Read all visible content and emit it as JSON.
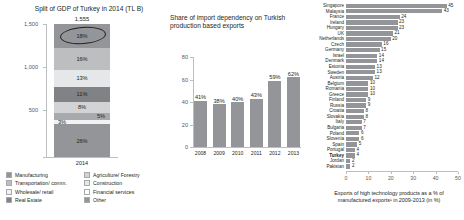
{
  "chart_data": [
    {
      "type": "bar",
      "id": "gdp-split",
      "title": "Split of GDP of Turkey in 2014 (TL B)",
      "xlabel": "2014",
      "ylabel": "",
      "ylim": [
        0,
        1555
      ],
      "yticks": [
        "500",
        "1,000",
        "1,500"
      ],
      "total_label": "1,555",
      "categories": [
        "2014"
      ],
      "stack_order_top_to_bottom": [
        {
          "label": "18%",
          "value": 18,
          "name": "Manufacturing",
          "color": "#939598"
        },
        {
          "label": "16%",
          "value": 16,
          "name": "Transportation/ comm.",
          "color": "#bcbec0"
        },
        {
          "label": "13%",
          "value": 13,
          "name": "Wholesale/ retail",
          "color": "#e6e7e8"
        },
        {
          "label": "11%",
          "value": 11,
          "name": "Real Estate",
          "color": "#808285"
        },
        {
          "label": "8%",
          "value": 8,
          "name": "Agriculture/ Forestry",
          "color": "#d1d3d4"
        },
        {
          "label": "5%",
          "value": 5,
          "name": "Construction",
          "color": "#a7a9ac"
        },
        {
          "label": "3%",
          "value": 3,
          "name": "Financial services",
          "color": "#f1f2f2"
        },
        {
          "label": "26%",
          "value": 26,
          "name": "Other",
          "color": "#939598"
        }
      ],
      "annotation": "ellipse-highlight-on-manufacturing",
      "legend": [
        {
          "label": "Manufacturing",
          "color": "#939598"
        },
        {
          "label": "Agriculture/ Forestry",
          "color": "#d1d3d4"
        },
        {
          "label": "Transportation/ comm.",
          "color": "#bcbec0"
        },
        {
          "label": "Construction",
          "color": "#e6e7e8"
        },
        {
          "label": "Wholesale/ retail",
          "color": "#f1f2f2"
        },
        {
          "label": "Financial services",
          "color": "#ffffff"
        },
        {
          "label": "Real Estate",
          "color": "#808285"
        },
        {
          "label": "Other",
          "color": "#939598"
        }
      ]
    },
    {
      "type": "bar",
      "id": "import-dependency",
      "title": "Share of import dependency on Turkish production based exports",
      "xlabel": "",
      "ylabel": "",
      "ylim": [
        0,
        80
      ],
      "yticks": [
        "0",
        "20",
        "40",
        "60",
        "80"
      ],
      "categories": [
        "2008",
        "2009",
        "2010",
        "2011",
        "2012",
        "2013"
      ],
      "values": [
        41,
        38,
        40,
        43,
        59,
        62
      ],
      "value_labels": [
        "41%",
        "38%",
        "40%",
        "43%",
        "59%",
        "62%"
      ],
      "bar_color": "#939598"
    },
    {
      "type": "bar",
      "id": "high-tech-exports",
      "orientation": "horizontal",
      "title": "",
      "caption": "Exports of high technology products as a % of manufactured exports¹ in 2009-2013 (in %)",
      "xlim": [
        0,
        50
      ],
      "xticks": [
        "0",
        "10",
        "20",
        "30",
        "40",
        "50"
      ],
      "bar_color": "#939598",
      "highlight": "Turkey",
      "categories": [
        "Singapore",
        "Malaysia",
        "France",
        "Ireland",
        "Hungary",
        "UK",
        "Netherlands",
        "Czech",
        "Germany",
        "Israel",
        "Denmark",
        "Estonia",
        "Sweden",
        "Austria",
        "Belgium",
        "Romania",
        "Greece",
        "Finland",
        "Russia",
        "Croatia",
        "Slovakia",
        "Italy",
        "Bulgaria",
        "Poland",
        "Slovenia",
        "Spain",
        "Portugal",
        "Turkey",
        "Jordan",
        "Pakistan"
      ],
      "values": [
        45,
        43,
        24,
        23,
        23,
        21,
        20,
        16,
        15,
        14,
        14,
        13,
        13,
        12,
        10,
        10,
        10,
        9,
        9,
        8,
        8,
        7,
        7,
        6,
        6,
        5,
        4,
        4,
        2,
        2
      ],
      "value_labels": [
        "45",
        "43",
        "24",
        "23",
        "23",
        "21",
        "20",
        "16",
        "15",
        "14",
        "14",
        "13",
        "13",
        "12",
        "10",
        "10",
        "10",
        "9",
        "9",
        "8",
        "8",
        "7",
        "7",
        "6",
        "6",
        "5",
        "4",
        "4",
        "2",
        "2"
      ]
    }
  ]
}
